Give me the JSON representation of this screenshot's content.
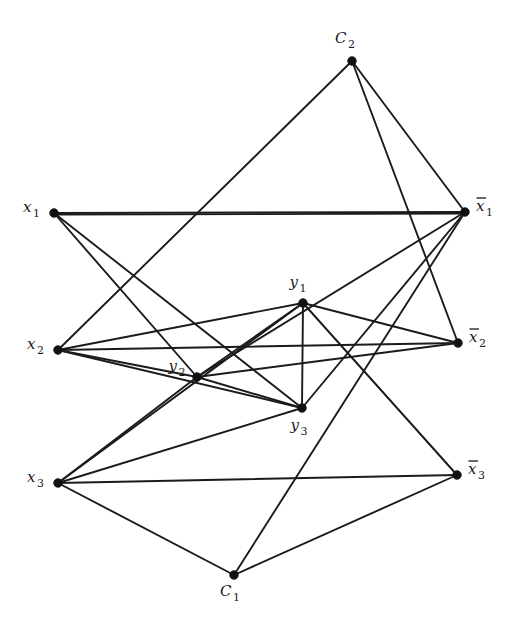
{
  "figure": {
    "background_color": "#ffffff",
    "edge_color": "#1b1b1b",
    "vertex_color": "#111111",
    "width": 513,
    "height": 630
  },
  "nodes": [
    {
      "id": "C2",
      "label": "C",
      "sub": "2",
      "bar": false,
      "x": 352,
      "y": 61,
      "label_x": 345,
      "label_y": 43,
      "anchor": "middle"
    },
    {
      "id": "x1",
      "label": "x",
      "sub": "1",
      "bar": false,
      "x": 54,
      "y": 213,
      "label_x": 40,
      "label_y": 212,
      "anchor": "end"
    },
    {
      "id": "nx1",
      "label": "x",
      "sub": "1",
      "bar": true,
      "x": 465,
      "y": 212,
      "label_x": 476,
      "label_y": 211,
      "anchor": "start"
    },
    {
      "id": "y1",
      "label": "y",
      "sub": "1",
      "bar": false,
      "x": 303,
      "y": 303,
      "label_x": 298,
      "label_y": 287,
      "anchor": "middle"
    },
    {
      "id": "x2",
      "label": "x",
      "sub": "2",
      "bar": false,
      "x": 58,
      "y": 350,
      "label_x": 44,
      "label_y": 349,
      "anchor": "end"
    },
    {
      "id": "nx2",
      "label": "x",
      "sub": "2",
      "bar": true,
      "x": 458,
      "y": 343,
      "label_x": 469,
      "label_y": 342,
      "anchor": "start"
    },
    {
      "id": "y2",
      "label": "y",
      "sub": "2",
      "bar": false,
      "x": 197,
      "y": 377,
      "label_x": 177,
      "label_y": 371,
      "anchor": "middle"
    },
    {
      "id": "y3",
      "label": "y",
      "sub": "3",
      "bar": false,
      "x": 302,
      "y": 408,
      "label_x": 299,
      "label_y": 430,
      "anchor": "middle"
    },
    {
      "id": "x3",
      "label": "x",
      "sub": "3",
      "bar": false,
      "x": 58,
      "y": 483,
      "label_x": 44,
      "label_y": 482,
      "anchor": "end"
    },
    {
      "id": "nx3",
      "label": "x",
      "sub": "3",
      "bar": true,
      "x": 457,
      "y": 475,
      "label_x": 468,
      "label_y": 474,
      "anchor": "start"
    },
    {
      "id": "C1",
      "label": "C",
      "sub": "1",
      "bar": false,
      "x": 234,
      "y": 575,
      "label_x": 230,
      "label_y": 596,
      "anchor": "middle"
    }
  ],
  "edges": [
    {
      "from": "x1",
      "to": "nx1"
    },
    {
      "from": "x2",
      "to": "nx2"
    },
    {
      "from": "x3",
      "to": "nx3"
    },
    {
      "from": "x1",
      "to": "y2"
    },
    {
      "from": "x1",
      "to": "y3"
    },
    {
      "from": "x2",
      "to": "y1"
    },
    {
      "from": "x2",
      "to": "y3"
    },
    {
      "from": "x2",
      "to": "y2"
    },
    {
      "from": "x3",
      "to": "y1"
    },
    {
      "from": "x3",
      "to": "y2"
    },
    {
      "from": "x3",
      "to": "y3"
    },
    {
      "from": "nx1",
      "to": "y2"
    },
    {
      "from": "nx1",
      "to": "y3"
    },
    {
      "from": "nx2",
      "to": "y1"
    },
    {
      "from": "nx2",
      "to": "y2"
    },
    {
      "from": "nx3",
      "to": "y1"
    },
    {
      "from": "y1",
      "to": "y2"
    },
    {
      "from": "y1",
      "to": "y3"
    },
    {
      "from": "y2",
      "to": "y3"
    },
    {
      "from": "C2",
      "to": "nx1"
    },
    {
      "from": "C2",
      "to": "nx2"
    },
    {
      "from": "C2",
      "to": "x2"
    },
    {
      "from": "C1",
      "to": "x3"
    },
    {
      "from": "C1",
      "to": "nx3"
    },
    {
      "from": "C1",
      "to": "nx1"
    },
    {
      "from": "x1",
      "to": "nx1",
      "dup": true
    }
  ],
  "legend": {
    "variable_nodes": [
      "x1",
      "x1-bar",
      "x2",
      "x2-bar",
      "x3",
      "x3-bar"
    ],
    "clause_nodes": [
      "C1",
      "C2"
    ],
    "triangle_nodes": [
      "y1",
      "y2",
      "y3"
    ]
  }
}
